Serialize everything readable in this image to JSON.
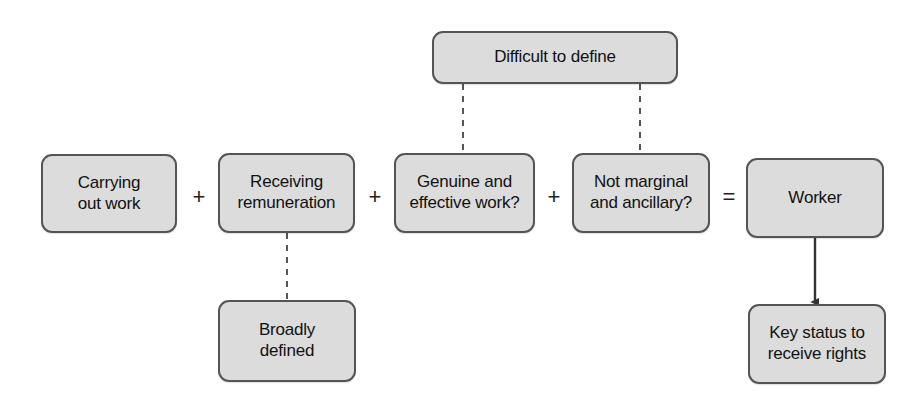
{
  "diagram": {
    "background_color": "#ffffff",
    "node_fill_color": "#dcdcdc",
    "node_border_color": "#555555",
    "text_color": "#111111",
    "connector_color": "#555555",
    "arrow_color": "#333333",
    "nodes": [
      {
        "id": "difficult-to-define",
        "label": "Difficult to define",
        "x": 432,
        "y": 31,
        "w": 246,
        "h": 53,
        "font_size": 17
      },
      {
        "id": "carrying-out-work",
        "label": "Carrying\nout work",
        "x": 41,
        "y": 154,
        "w": 136,
        "h": 79,
        "font_size": 17
      },
      {
        "id": "receiving-remuneration",
        "label": "Receiving\nremuneration",
        "x": 218,
        "y": 153,
        "w": 137,
        "h": 80,
        "font_size": 17
      },
      {
        "id": "genuine-and-effective-work",
        "label": "Genuine and\neffective work?",
        "x": 394,
        "y": 153,
        "w": 141,
        "h": 80,
        "font_size": 17
      },
      {
        "id": "not-marginal-and-ancillary",
        "label": "Not marginal\nand ancillary?",
        "x": 572,
        "y": 153,
        "w": 138,
        "h": 80,
        "font_size": 17
      },
      {
        "id": "worker",
        "label": "Worker",
        "x": 746,
        "y": 158,
        "w": 138,
        "h": 80,
        "font_size": 17
      },
      {
        "id": "broadly-defined",
        "label": "Broadly\ndefined",
        "x": 218,
        "y": 300,
        "w": 138,
        "h": 82,
        "font_size": 17
      },
      {
        "id": "key-status-to-receive-rights",
        "label": "Key status to\nreceive rights",
        "x": 748,
        "y": 304,
        "w": 138,
        "h": 80,
        "font_size": 17
      }
    ],
    "operators": [
      {
        "id": "plus-1",
        "symbol": "+",
        "x": 189,
        "y": 186
      },
      {
        "id": "plus-2",
        "symbol": "+",
        "x": 365,
        "y": 186
      },
      {
        "id": "plus-3",
        "symbol": "+",
        "x": 544,
        "y": 186
      },
      {
        "id": "equals-1",
        "symbol": "=",
        "x": 719,
        "y": 186
      }
    ],
    "connectors": [
      {
        "id": "difficult-to-genuine",
        "style": "dashed",
        "from": "difficult-to-define",
        "to": "genuine-and-effective-work",
        "x1": 463,
        "y1": 84,
        "x2": 463,
        "y2": 153
      },
      {
        "id": "difficult-to-not-marginal",
        "style": "dashed",
        "from": "difficult-to-define",
        "to": "not-marginal-and-ancillary",
        "x1": 640,
        "y1": 84,
        "x2": 640,
        "y2": 153
      },
      {
        "id": "remuneration-to-broadly-defined",
        "style": "dashed",
        "from": "receiving-remuneration",
        "to": "broadly-defined",
        "x1": 287,
        "y1": 233,
        "x2": 287,
        "y2": 300
      },
      {
        "id": "worker-to-key-status",
        "style": "arrow",
        "from": "worker",
        "to": "key-status-to-receive-rights",
        "x1": 815,
        "y1": 238,
        "x2": 815,
        "y2": 302
      }
    ]
  }
}
